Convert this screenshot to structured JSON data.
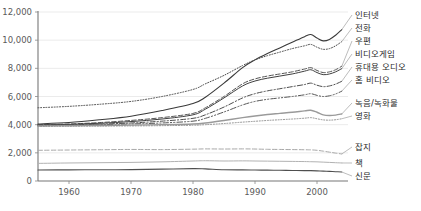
{
  "chart_data": {
    "type": "line",
    "title": "",
    "xlabel": "",
    "ylabel": "",
    "xlim": [
      1955,
      2005
    ],
    "ylim": [
      0,
      12000
    ],
    "grid": true,
    "legend_position": "right-inline-labels",
    "y_ticks": [
      "0",
      "2,000",
      "4,000",
      "6,000",
      "8,000",
      "10,000",
      "12,000"
    ],
    "y_tick_values": [
      0,
      2000,
      4000,
      6000,
      8000,
      10000,
      12000
    ],
    "x_ticks": [
      "1960",
      "1970",
      "1980",
      "1990",
      "2000"
    ],
    "x_tick_values": [
      1960,
      1970,
      1980,
      1990,
      2000
    ],
    "x": [
      1955,
      1960,
      1965,
      1970,
      1975,
      1980,
      1982,
      1985,
      1988,
      1990,
      1992,
      1994,
      1996,
      1998,
      1999,
      2000,
      2001,
      2002,
      2003,
      2004
    ],
    "series": [
      {
        "name": "인터넷",
        "label": "인터넷",
        "style": "solid",
        "color": "#3a3a3a",
        "width": 1.1,
        "label_y": 18,
        "values": [
          4050,
          4150,
          4350,
          4600,
          5000,
          5500,
          5950,
          6950,
          8050,
          8600,
          9050,
          9450,
          9850,
          10250,
          10400,
          10150,
          9950,
          10050,
          10350,
          10750
        ]
      },
      {
        "name": "전화",
        "label": "전화",
        "style": "dotted",
        "color": "#4a4a4a",
        "width": 1.0,
        "label_y": 31,
        "values": [
          5200,
          5300,
          5450,
          5650,
          6000,
          6500,
          6900,
          7500,
          8200,
          8600,
          8900,
          9150,
          9400,
          9600,
          9700,
          9500,
          9350,
          9400,
          9600,
          9900
        ]
      },
      {
        "name": "우편",
        "label": "우편",
        "style": "dashed",
        "color": "#555555",
        "width": 1.0,
        "label_y": 44,
        "values": [
          4000,
          4050,
          4150,
          4300,
          4500,
          4800,
          5200,
          6000,
          6900,
          7250,
          7450,
          7600,
          7750,
          7950,
          8050,
          7850,
          7700,
          7750,
          7900,
          8150
        ]
      },
      {
        "name": "비디오게임",
        "label": "비디오게임",
        "style": "solid",
        "color": "#3f3f3f",
        "width": 1.0,
        "label_y": 57,
        "values": [
          3980,
          4020,
          4100,
          4220,
          4400,
          4700,
          5100,
          5900,
          6750,
          7100,
          7300,
          7450,
          7600,
          7800,
          7900,
          7700,
          7550,
          7600,
          7750,
          7980
        ]
      },
      {
        "name": "휴대용 오디오",
        "label": "휴대용 오디오",
        "style": "dashdot",
        "color": "#4d4d4d",
        "width": 1.0,
        "label_y": 70,
        "values": [
          3960,
          3990,
          4040,
          4120,
          4250,
          4450,
          4700,
          5250,
          5900,
          6200,
          6400,
          6550,
          6700,
          6850,
          6950,
          6800,
          6700,
          6750,
          6880,
          7080
        ]
      },
      {
        "name": "홈 비디오",
        "label": "홈 비디오",
        "style": "dashdotdot",
        "color": "#565656",
        "width": 1.0,
        "label_y": 83,
        "values": [
          3950,
          3970,
          4000,
          4050,
          4120,
          4250,
          4450,
          4900,
          5400,
          5650,
          5800,
          5900,
          6000,
          6120,
          6200,
          6080,
          6000,
          6050,
          6180,
          6380
        ]
      },
      {
        "name": "녹음/녹화물",
        "label": "녹음/녹화물",
        "style": "solid",
        "color": "#9a9a9a",
        "width": 1.4,
        "label_y": 106,
        "values": [
          3900,
          3920,
          3940,
          3970,
          4000,
          4050,
          4120,
          4300,
          4500,
          4620,
          4720,
          4800,
          4880,
          4980,
          5020,
          4880,
          4700,
          4650,
          4680,
          4760
        ]
      },
      {
        "name": "영화",
        "label": "영화",
        "style": "dotted",
        "color": "#8e8e8e",
        "width": 1.0,
        "label_y": 119,
        "values": [
          3880,
          3890,
          3900,
          3910,
          3930,
          3960,
          4000,
          4080,
          4180,
          4240,
          4300,
          4350,
          4400,
          4460,
          4500,
          4420,
          4340,
          4320,
          4350,
          4420
        ]
      },
      {
        "name": "잡지",
        "label": "잡지",
        "style": "dashed",
        "color": "#a8a8a8",
        "width": 1.0,
        "label_y": 150,
        "values": [
          2180,
          2200,
          2220,
          2240,
          2230,
          2260,
          2280,
          2270,
          2280,
          2270,
          2250,
          2240,
          2230,
          2220,
          2210,
          2180,
          2120,
          2050,
          1980,
          1920
        ]
      },
      {
        "name": "책",
        "label": "책",
        "style": "solid",
        "color": "#b2b2b2",
        "width": 1.0,
        "label_y": 166,
        "values": [
          1250,
          1280,
          1300,
          1320,
          1360,
          1420,
          1440,
          1420,
          1430,
          1420,
          1410,
          1400,
          1390,
          1380,
          1370,
          1360,
          1340,
          1320,
          1300,
          1280
        ]
      },
      {
        "name": "신문",
        "label": "신문",
        "style": "solid",
        "color": "#4f4f4f",
        "width": 1.1,
        "label_y": 179,
        "values": [
          780,
          790,
          800,
          810,
          840,
          880,
          860,
          800,
          790,
          780,
          770,
          760,
          750,
          740,
          735,
          720,
          700,
          680,
          660,
          640
        ]
      }
    ]
  },
  "top_cropped_text": "",
  "axes": {
    "plot_left": 38,
    "plot_right": 348,
    "plot_top": 12,
    "plot_bottom": 181
  }
}
